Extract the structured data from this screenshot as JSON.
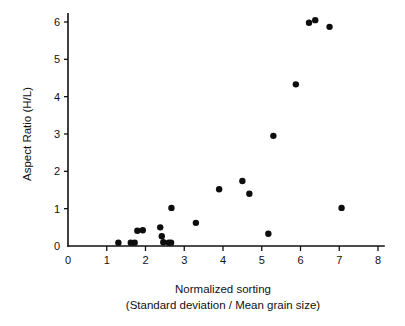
{
  "chart_data": {
    "type": "scatter",
    "title": "",
    "xlabel": "Normalized sorting",
    "xlabel_line2": "(Standard deviation / Mean grain size)",
    "ylabel": "Aspect Ratio (H/L)",
    "xlim": [
      0,
      8
    ],
    "ylim": [
      0,
      6.3
    ],
    "xticks": [
      0,
      1,
      2,
      3,
      4,
      5,
      6,
      7,
      8
    ],
    "yticks": [
      0,
      1,
      2,
      3,
      4,
      5,
      6
    ],
    "xtick_labels": [
      "0",
      "1",
      "2",
      "3",
      "4",
      "5",
      "6",
      "7",
      "8"
    ],
    "ytick_labels": [
      "0",
      "1",
      "2",
      "3",
      "4",
      "5",
      "6"
    ],
    "grid": false,
    "legend": false,
    "marker": "filled-circle",
    "marker_color": "#0d0d0d",
    "marker_size": 3.2,
    "series": [
      {
        "name": "samples",
        "points": [
          {
            "x": 1.3,
            "y": 0.09
          },
          {
            "x": 1.62,
            "y": 0.09
          },
          {
            "x": 1.72,
            "y": 0.09
          },
          {
            "x": 1.79,
            "y": 0.41
          },
          {
            "x": 1.93,
            "y": 0.42
          },
          {
            "x": 2.38,
            "y": 0.5
          },
          {
            "x": 2.42,
            "y": 0.26
          },
          {
            "x": 2.46,
            "y": 0.1
          },
          {
            "x": 2.6,
            "y": 0.09
          },
          {
            "x": 2.66,
            "y": 0.09
          },
          {
            "x": 2.67,
            "y": 1.02
          },
          {
            "x": 3.3,
            "y": 0.62
          },
          {
            "x": 3.9,
            "y": 1.52
          },
          {
            "x": 4.5,
            "y": 1.74
          },
          {
            "x": 4.68,
            "y": 1.4
          },
          {
            "x": 5.17,
            "y": 0.33
          },
          {
            "x": 5.3,
            "y": 2.95
          },
          {
            "x": 5.88,
            "y": 4.33
          },
          {
            "x": 6.22,
            "y": 5.98
          },
          {
            "x": 6.38,
            "y": 6.05
          },
          {
            "x": 6.75,
            "y": 5.87
          },
          {
            "x": 7.06,
            "y": 1.02
          }
        ]
      }
    ]
  }
}
